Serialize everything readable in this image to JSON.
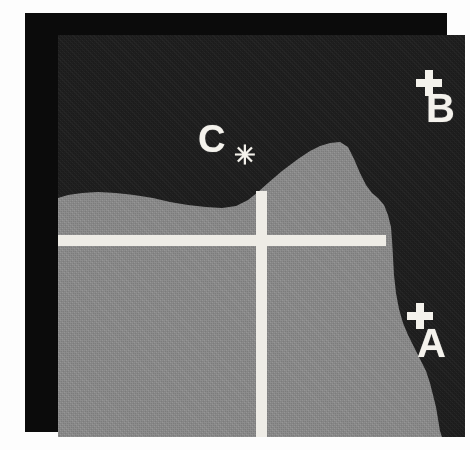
{
  "figure": {
    "kind": "map-figure",
    "frame_color": "#0b0b0b",
    "page_background": "#fdfdfd"
  },
  "map": {
    "sea_color": "#1e1e1e",
    "land_color": "#8a8a8a",
    "line_color": "#eeece6",
    "land_outline_points": "0,163 10,160 24,158 40,157 58,158 76,160 95,163 112,167 130,170 148,172 164,173 178,171 190,165 200,157 210,148 224,136 240,124 252,116 262,111 272,108 282,107 290,112 296,124 302,138 308,150 314,158 320,163 326,170 330,180 333,192 334,205 335,222 336,240 338,258 341,274 345,288 350,300 356,312 362,324 368,336 372,348 375,360 378,372 380,384 382,396 384,402 0,402",
    "grid": {
      "horizontal_line": {
        "y": 200,
        "x_start": 0,
        "x_end": 328,
        "thickness": 11
      },
      "vertical_line": {
        "x": 198,
        "y_start": 156,
        "y_end": 402,
        "thickness": 11
      }
    }
  },
  "markers": [
    {
      "id": "b",
      "label": "B",
      "marker_icon": "plus-marker-icon",
      "position": {
        "x": 350,
        "y": 35
      },
      "region": "sea"
    },
    {
      "id": "a",
      "label": "A",
      "marker_icon": "plus-marker-icon",
      "position": {
        "x": 345,
        "y": 268
      },
      "region": "sea"
    },
    {
      "id": "c",
      "label": "C",
      "marker_icon": "asterisk-marker-icon",
      "marker_glyph": "✳",
      "position": {
        "x": 140,
        "y": 85
      },
      "region": "sea"
    }
  ]
}
